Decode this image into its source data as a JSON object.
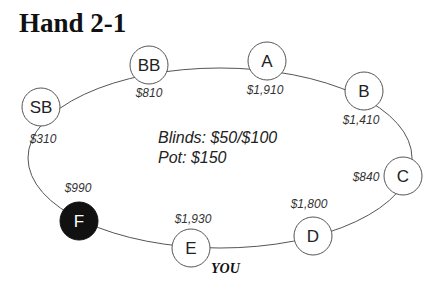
{
  "title": "Hand 2-1",
  "table": {
    "blinds_text": "Blinds: $50/$100",
    "pot_text": "Pot: $150",
    "you_label": "YOU"
  },
  "seats": [
    {
      "name": "SB",
      "stack": "$310",
      "highlighted": false
    },
    {
      "name": "BB",
      "stack": "$810",
      "highlighted": false
    },
    {
      "name": "A",
      "stack": "$1,910",
      "highlighted": false
    },
    {
      "name": "B",
      "stack": "$1,410",
      "highlighted": false
    },
    {
      "name": "C",
      "stack": "$840",
      "highlighted": false
    },
    {
      "name": "D",
      "stack": "$1,800",
      "highlighted": false
    },
    {
      "name": "E",
      "stack": "$1,930",
      "highlighted": false
    },
    {
      "name": "F",
      "stack": "$990",
      "highlighted": true
    }
  ]
}
